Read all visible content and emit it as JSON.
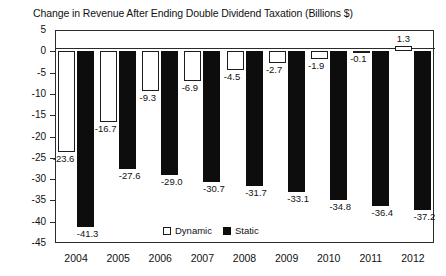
{
  "chart_data": {
    "type": "bar",
    "title": "Change in Revenue After Ending Double Dividend Taxation (Billions $)",
    "xlabel": "",
    "ylabel": "",
    "ylim": [
      -45,
      5
    ],
    "yticks": [
      5,
      0,
      -5,
      -10,
      -15,
      -20,
      -25,
      -30,
      -35,
      -40,
      -45
    ],
    "ytick_labels": [
      "5",
      "0",
      "-5",
      "-10",
      "-15",
      "-20",
      "-25",
      "-30",
      "-35",
      "-40",
      "-45"
    ],
    "grid": false,
    "legend_position": "bottom-center",
    "categories": [
      "2004",
      "2005",
      "2006",
      "2007",
      "2008",
      "2009",
      "2010",
      "2011",
      "2012"
    ],
    "series": [
      {
        "name": "Dynamic",
        "color": "#ffffff",
        "edge_color": "#1c1c1c",
        "values": [
          -23.6,
          -16.7,
          -9.3,
          -6.9,
          -4.5,
          -2.7,
          -1.9,
          -0.1,
          1.3
        ],
        "labels": [
          "-23.6",
          "-16.7",
          "-9.3",
          "-6.9",
          "-4.5",
          "-2.7",
          "-1.9",
          "-0.1",
          "1.3"
        ]
      },
      {
        "name": "Static",
        "color": "#0d0d0d",
        "edge_color": "#0d0d0d",
        "values": [
          -41.3,
          -27.6,
          -29.0,
          -30.7,
          -31.7,
          -33.1,
          -34.8,
          -36.4,
          -37.2
        ],
        "labels": [
          "-41.3",
          "-27.6",
          "-29.0",
          "-30.7",
          "-31.7",
          "-33.1",
          "-34.8",
          "-36.4",
          "-37.2"
        ]
      }
    ]
  },
  "legend": {
    "dynamic_label": "Dynamic",
    "static_label": "Static"
  }
}
